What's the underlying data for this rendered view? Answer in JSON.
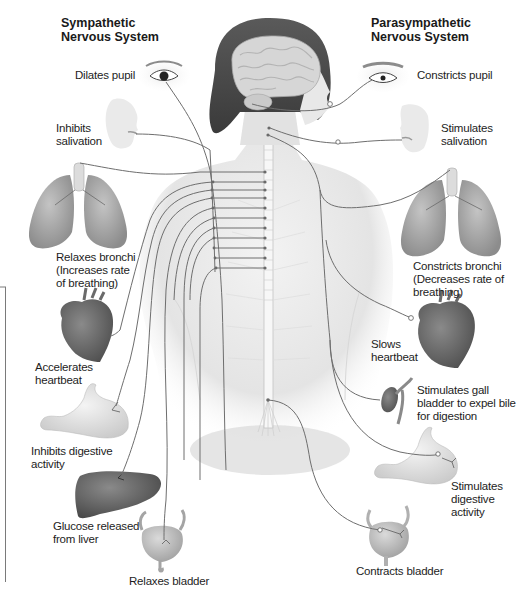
{
  "titles": {
    "sympathetic": "Sympathetic\nNervous System",
    "parasympathetic": "Parasympathetic\nNervous System"
  },
  "sympathetic_effects": [
    {
      "organ": "eye",
      "label": "Dilates pupil"
    },
    {
      "organ": "salivary-glands",
      "label": "Inhibits\nsalivation"
    },
    {
      "organ": "lungs",
      "label": "Relaxes bronchi\n(Increases rate\nof breathing)"
    },
    {
      "organ": "heart",
      "label": "Accelerates\nheartbeat"
    },
    {
      "organ": "stomach",
      "label": "Inhibits digestive\nactivity"
    },
    {
      "organ": "liver",
      "label": "Glucose released\nfrom liver"
    },
    {
      "organ": "bladder",
      "label": "Relaxes bladder"
    }
  ],
  "parasympathetic_effects": [
    {
      "organ": "eye",
      "label": "Constricts pupil"
    },
    {
      "organ": "salivary-glands",
      "label": "Stimulates\nsalivation"
    },
    {
      "organ": "lungs",
      "label": "Constricts bronchi\n(Decreases rate of\nbreathing)"
    },
    {
      "organ": "heart",
      "label": "Slows\nheartbeat"
    },
    {
      "organ": "gall-bladder",
      "label": "Stimulates gall\nbladder to expel bile\nfor digestion"
    },
    {
      "organ": "stomach",
      "label": "Stimulates\ndigestive\nactivity"
    },
    {
      "organ": "bladder",
      "label": "Contracts bladder"
    }
  ],
  "colors": {
    "nerve": "#6b6b6b",
    "skin": "#e6e6e6",
    "hair": "#4a4a4a",
    "brain": "#d2d2d2",
    "organ": "#9a9a9a",
    "organ_light": "#cfcfcf"
  }
}
